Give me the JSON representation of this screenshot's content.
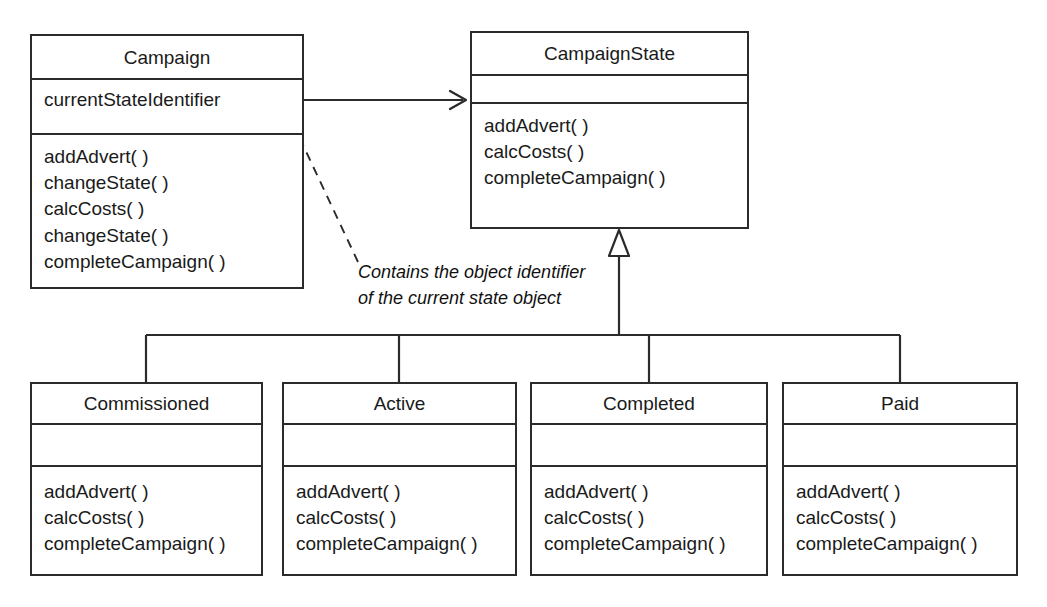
{
  "diagram": {
    "kind": "uml-class-diagram",
    "background_color": "#ffffff",
    "line_color": "#2b2b2b",
    "text_color": "#1a1a1a"
  },
  "classes": {
    "campaign": {
      "name": "Campaign",
      "attributes": [
        "currentStateIdentifier"
      ],
      "operations": [
        "addAdvert( )",
        "changeState( )",
        "calcCosts( )",
        "changeState( )",
        "completeCampaign( )"
      ]
    },
    "campaign_state": {
      "name": "CampaignState",
      "attributes": [],
      "operations": [
        "addAdvert( )",
        "calcCosts( )",
        "completeCampaign( )"
      ]
    },
    "commissioned": {
      "name": "Commissioned",
      "attributes": [],
      "operations": [
        "addAdvert( )",
        "calcCosts( )",
        "completeCampaign( )"
      ]
    },
    "active": {
      "name": "Active",
      "attributes": [],
      "operations": [
        "addAdvert( )",
        "calcCosts( )",
        "completeCampaign( )"
      ]
    },
    "completed": {
      "name": "Completed",
      "attributes": [],
      "operations": [
        "addAdvert( )",
        "calcCosts( )",
        "completeCampaign( )"
      ]
    },
    "paid": {
      "name": "Paid",
      "attributes": [],
      "operations": [
        "addAdvert( )",
        "calcCosts( )",
        "completeCampaign( )"
      ]
    }
  },
  "note": {
    "line1": "Contains the object identifier",
    "line2": "of the current state object"
  },
  "relationships": {
    "association": {
      "from": "Campaign",
      "to": "CampaignState",
      "style": "open-arrow"
    },
    "generalization": {
      "parent": "CampaignState",
      "children": [
        "Commissioned",
        "Active",
        "Completed",
        "Paid"
      ],
      "style": "hollow-triangle"
    },
    "note_anchor": {
      "from": "note",
      "to": "Campaign.currentStateIdentifier",
      "style": "dashed-arrow"
    }
  }
}
